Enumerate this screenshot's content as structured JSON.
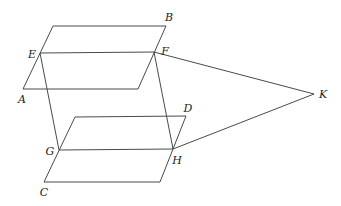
{
  "diagram": {
    "type": "geometry-figure",
    "stroke_color": "#4a4a4a",
    "background": "#ffffff",
    "planes": [
      {
        "name": "upper-plane",
        "corners": [
          [
            53,
            26
          ],
          [
            166,
            26
          ],
          [
            138,
            89
          ],
          [
            23,
            89
          ]
        ]
      },
      {
        "name": "lower-plane",
        "corners": [
          [
            75,
            117
          ],
          [
            186,
            116
          ],
          [
            160,
            182
          ],
          [
            44,
            182
          ]
        ]
      }
    ],
    "points": {
      "E": [
        40,
        53
      ],
      "F": [
        154,
        52
      ],
      "G": [
        59,
        150
      ],
      "H": [
        173,
        149
      ],
      "K": [
        314,
        94
      ]
    },
    "segments": [
      {
        "name": "EF",
        "from": "E",
        "to": "F"
      },
      {
        "name": "GH",
        "from": "G",
        "to": "H"
      },
      {
        "name": "EG",
        "from": "E",
        "to": "G"
      },
      {
        "name": "FH",
        "from": "F",
        "to": "H"
      },
      {
        "name": "FK",
        "from": "F",
        "to": "K"
      },
      {
        "name": "HK",
        "from": "H",
        "to": "K"
      }
    ],
    "labels": [
      {
        "id": "B",
        "text": "B",
        "x": 169,
        "y": 17
      },
      {
        "id": "E",
        "text": "E",
        "x": 32,
        "y": 54
      },
      {
        "id": "F",
        "text": "F",
        "x": 165,
        "y": 51
      },
      {
        "id": "A",
        "text": "A",
        "x": 22,
        "y": 99
      },
      {
        "id": "D",
        "text": "D",
        "x": 188,
        "y": 108
      },
      {
        "id": "G",
        "text": "G",
        "x": 50,
        "y": 151
      },
      {
        "id": "H",
        "text": "H",
        "x": 177,
        "y": 160
      },
      {
        "id": "C",
        "text": "C",
        "x": 44,
        "y": 192
      },
      {
        "id": "K",
        "text": "K",
        "x": 323,
        "y": 94
      }
    ]
  }
}
